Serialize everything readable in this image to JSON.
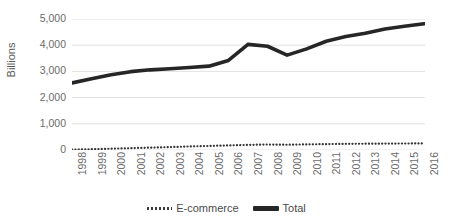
{
  "chart_data": {
    "type": "line",
    "title": "",
    "subtitle": "",
    "xlabel": "",
    "ylabel": "Billions",
    "ylim": [
      0,
      5000
    ],
    "xlim": [
      1998,
      2016
    ],
    "grid": true,
    "legend_position": "bottom-center",
    "y_ticks": [
      "0",
      "1,000",
      "2,000",
      "3,000",
      "4,000",
      "5,000"
    ],
    "y_tick_values": [
      0,
      1000,
      2000,
      3000,
      4000,
      5000
    ],
    "categories": [
      "1998",
      "1999",
      "2000",
      "2001",
      "2002",
      "2003",
      "2004",
      "2005",
      "2006",
      "2007",
      "2008",
      "2009",
      "2010",
      "2011",
      "2012",
      "2013",
      "2014",
      "2015",
      "2016"
    ],
    "series": [
      {
        "name": "E-commerce",
        "style": "dotted",
        "color": "#333333",
        "values": [
          15,
          30,
          50,
          70,
          90,
          110,
          135,
          155,
          175,
          195,
          210,
          200,
          215,
          225,
          235,
          240,
          245,
          248,
          252
        ]
      },
      {
        "name": "Total",
        "style": "solid-thick",
        "color": "#262626",
        "values": [
          2560,
          2720,
          2870,
          2990,
          3060,
          3100,
          3150,
          3200,
          3420,
          4030,
          3960,
          3620,
          3860,
          4150,
          4330,
          4460,
          4620,
          4720,
          4820
        ]
      }
    ]
  },
  "legend": {
    "items": [
      {
        "label": "E-commerce",
        "marker": "dotted-line-icon"
      },
      {
        "label": "Total",
        "marker": "solid-line-icon"
      }
    ]
  },
  "axis": {
    "y_title": "Billions"
  }
}
